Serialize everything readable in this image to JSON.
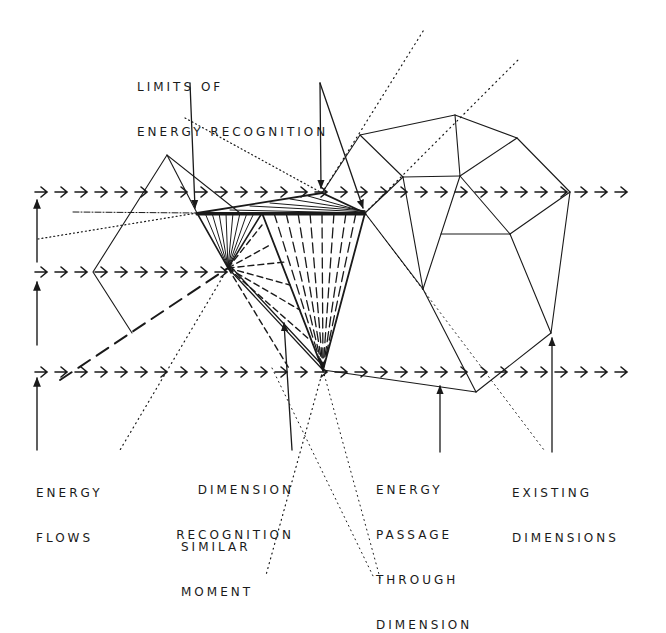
{
  "diagram": {
    "ink_color": "#1a1a1a",
    "background": "#ffffff",
    "labels": {
      "limits": [
        "LIMITS OF",
        "ENERGY RECOGNITION"
      ],
      "energy_flows": [
        "ENERGY",
        "FLOWS"
      ],
      "dimension_recognition": [
        "DIMENSION",
        "RECOGNITION"
      ],
      "similar_moment": [
        "SIMILAR",
        "MOMENT"
      ],
      "energy_passage": [
        "ENERGY",
        "PASSAGE",
        "THROUGH",
        "DIMENSION"
      ],
      "existing_dimensions": [
        "EXISTING",
        "DIMENSIONS"
      ]
    },
    "flow_rows": [
      {
        "name": "top-flow",
        "y": 192,
        "x_start": 35,
        "x_end": 632
      },
      {
        "name": "middle-flow",
        "y": 272,
        "x_start": 35,
        "x_end": 225
      },
      {
        "name": "bottom-flow",
        "y": 372,
        "x_start": 35,
        "x_end": 632
      }
    ]
  }
}
